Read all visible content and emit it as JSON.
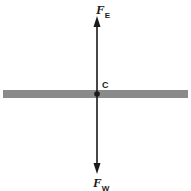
{
  "diagram": {
    "labels": {
      "top_force": {
        "main": "F",
        "sub": "E"
      },
      "bottom_force": {
        "main": "F",
        "sub": "W"
      },
      "center_point": "C"
    },
    "colors": {
      "bar": "#8a8a8a",
      "line": "#1a1a1a",
      "background": "#ffffff"
    }
  }
}
